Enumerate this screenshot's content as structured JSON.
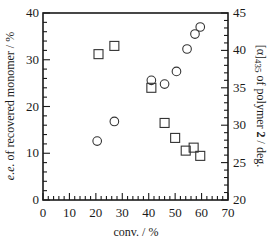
{
  "chart_data": {
    "type": "scatter",
    "title": "",
    "xlabel": "conv. / %",
    "ylabel_left": "e.e. of recovered monomer / %",
    "ylabel_right": "[α]435 of polymer 2 / deg.",
    "xlim": [
      0,
      70
    ],
    "ylim_left": [
      0,
      40
    ],
    "ylim_right": [
      20,
      45
    ],
    "x_ticks": [
      0,
      10,
      20,
      30,
      40,
      50,
      60,
      70
    ],
    "y_left_ticks": [
      0,
      10,
      20,
      30,
      40
    ],
    "y_right_ticks": [
      20,
      25,
      30,
      35,
      40,
      45
    ],
    "grid": false,
    "legend": null,
    "series": [
      {
        "name": "e.e. of recovered monomer",
        "marker": "circle",
        "axis": "left",
        "x": [
          20.5,
          27,
          41,
          46,
          50.5,
          54.5,
          57.5,
          59.5
        ],
        "values": [
          12.6,
          16.8,
          25.6,
          24.8,
          27.5,
          32.3,
          35.5,
          37.0
        ]
      },
      {
        "name": "[α]435 of polymer 2",
        "marker": "square",
        "axis": "right",
        "x": [
          21,
          27,
          41,
          46,
          50,
          54,
          57,
          59.5
        ],
        "values": [
          39.5,
          40.6,
          35.0,
          30.3,
          28.3,
          26.6,
          27.0,
          25.9
        ]
      }
    ]
  },
  "axes": {
    "x_title": "conv. / %",
    "y_left_title_italic": "e.e.",
    "y_left_title_rest": " of recovered monomer / %",
    "y_right_title_a": "[α]",
    "y_right_title_sub": "435",
    "y_right_title_b": " of polymer ",
    "y_right_title_bold": "2",
    "y_right_title_c": " / deg."
  },
  "colors": {
    "axis": "#1a1a1a",
    "marker_stroke": "#333333",
    "background": "#ffffff"
  }
}
